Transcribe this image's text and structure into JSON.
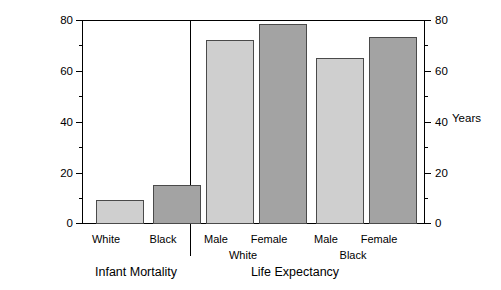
{
  "chart_data": {
    "type": "bar",
    "title": "",
    "ylabel": "Infant Deaths Per 1000 Births",
    "ylabel_right": "Years",
    "xlabel": "",
    "ylim": [
      0,
      80
    ],
    "yticks": [
      0,
      20,
      40,
      60,
      80
    ],
    "yticks_minor": [
      10,
      30,
      50,
      70
    ],
    "ylim_right": [
      0,
      80
    ],
    "yticks_right": [
      0,
      20,
      40,
      60,
      80
    ],
    "grid": false,
    "legend": "none",
    "panels": [
      {
        "name": "Infant Mortality",
        "categories": [
          "White",
          "Black"
        ],
        "values": [
          9.3,
          15.4
        ],
        "shades": [
          "light",
          "dark"
        ],
        "groups": []
      },
      {
        "name": "Life Expectancy",
        "categories": [
          "Male",
          "Female",
          "Male",
          "Female"
        ],
        "values": [
          72.0,
          78.4,
          65.0,
          73.4
        ],
        "shades": [
          "light",
          "dark",
          "light",
          "dark"
        ],
        "groups": [
          "White",
          "Black"
        ]
      }
    ]
  },
  "axes": {
    "left_title": "Infant Deaths Per 1000 Births",
    "right_title": "Years",
    "tick_labels": [
      "80",
      "60",
      "40",
      "20",
      "0"
    ]
  },
  "panel_one": {
    "title": "Infant Mortality",
    "bars": [
      {
        "label": "White",
        "value": 9.3
      },
      {
        "label": "Black",
        "value": 15.4
      }
    ]
  },
  "panel_two": {
    "title": "Life Expectancy",
    "bars": [
      {
        "label": "Male",
        "value": 72.0
      },
      {
        "label": "Female",
        "value": 78.4
      },
      {
        "label": "Male",
        "value": 65.0
      },
      {
        "label": "Female",
        "value": 73.4
      }
    ],
    "groups": [
      {
        "label": "White"
      },
      {
        "label": "Black"
      }
    ]
  },
  "colors": {
    "bar_light": "#cfcfcf",
    "bar_dark": "#a3a3a3",
    "bar_border": "#4a4a4a",
    "axis": "#000000",
    "background": "#ffffff"
  }
}
